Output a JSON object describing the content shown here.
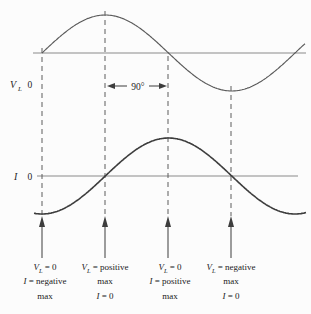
{
  "figure": {
    "background": "#fcfcfc",
    "colors": {
      "vl_curve": "#5a5a5a",
      "i_curve": "#3d3d3d",
      "axis": "#8a8a8a",
      "dashed_guide": "#5c5c5c",
      "arrow": "#3d3d3d",
      "text": "#1f1f1f"
    }
  },
  "axis_labels": {
    "vl": {
      "symbol": "V",
      "subscript": "L",
      "zero": "0"
    },
    "i": {
      "symbol": "I",
      "zero": "0"
    }
  },
  "phase_label": "90°",
  "chart_data": {
    "type": "line",
    "x_unit": "degrees",
    "x_range": [
      0,
      375
    ],
    "series": [
      {
        "name": "VL",
        "phase_deg": 0,
        "amplitude": 1,
        "x_deg": [
          0,
          90,
          180,
          270,
          360
        ],
        "values": [
          0,
          1,
          0,
          -1,
          0
        ]
      },
      {
        "name": "I",
        "phase_deg": -90,
        "amplitude": 1,
        "x_deg": [
          0,
          90,
          180,
          270,
          360
        ],
        "values": [
          -1,
          0,
          1,
          0,
          -1
        ]
      }
    ],
    "relationship": "current lags voltage by 90°"
  },
  "annotations": [
    {
      "lines": [
        {
          "sym": "V",
          "sub": "L",
          "rest": " = 0"
        },
        {
          "sym": "I",
          "sub": "",
          "rest": " = negative"
        },
        {
          "sym": "",
          "sub": "",
          "rest": "max"
        }
      ]
    },
    {
      "lines": [
        {
          "sym": "V",
          "sub": "L",
          "rest": " = positive"
        },
        {
          "sym": "",
          "sub": "",
          "rest": "max"
        },
        {
          "sym": "I",
          "sub": "",
          "rest": " = 0"
        }
      ]
    },
    {
      "lines": [
        {
          "sym": "V",
          "sub": "L",
          "rest": " = 0"
        },
        {
          "sym": "I",
          "sub": "",
          "rest": " = positive"
        },
        {
          "sym": "",
          "sub": "",
          "rest": "max"
        }
      ]
    },
    {
      "lines": [
        {
          "sym": "V",
          "sub": "L",
          "rest": " = negative"
        },
        {
          "sym": "",
          "sub": "",
          "rest": "max"
        },
        {
          "sym": "I",
          "sub": "",
          "rest": " = 0"
        }
      ]
    }
  ]
}
